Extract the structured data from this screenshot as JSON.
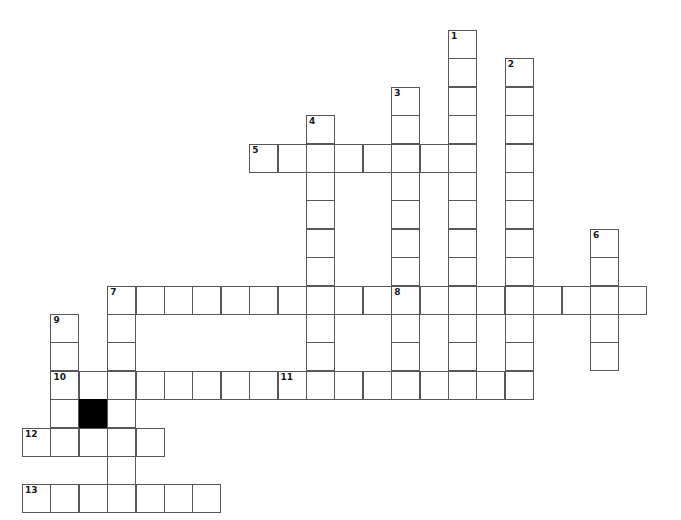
{
  "page": {
    "title_strip": "",
    "background_color": "#ffffff",
    "width": 681,
    "height": 520
  },
  "grid": {
    "cell_size": 28.4,
    "origin_x": 22,
    "origin_y": 30,
    "cell_border_color": "#58585a",
    "cell_fill_color": "#ffffff",
    "block_fill_color": "#000000",
    "number_color": "#16181b"
  },
  "clue_numbers": [
    1,
    2,
    3,
    4,
    5,
    6,
    7,
    8,
    9,
    10,
    11,
    12,
    13
  ],
  "entries": [
    {
      "number": 1,
      "direction": "down",
      "col": 15,
      "row": 0,
      "length": 11
    },
    {
      "number": 2,
      "direction": "down",
      "col": 17,
      "row": 1,
      "length": 12
    },
    {
      "number": 3,
      "direction": "down",
      "col": 13,
      "row": 2,
      "length": 8
    },
    {
      "number": 4,
      "direction": "down",
      "col": 10,
      "row": 3,
      "length": 8
    },
    {
      "number": 5,
      "direction": "across",
      "col": 8,
      "row": 4,
      "length": 8
    },
    {
      "number": 6,
      "direction": "down",
      "col": 20,
      "row": 7,
      "length": 5
    },
    {
      "number": 7,
      "direction": "across",
      "col": 3,
      "row": 9,
      "length": 10
    },
    {
      "number": 8,
      "direction": "across",
      "col": 13,
      "row": 9,
      "length": 9
    },
    {
      "number": 9,
      "direction": "down",
      "col": 1,
      "row": 10,
      "length": 5
    },
    {
      "number": 10,
      "direction": "across",
      "col": 1,
      "row": 12,
      "length": 8
    },
    {
      "number": 11,
      "direction": "across",
      "col": 9,
      "row": 12,
      "length": 9
    },
    {
      "number": 12,
      "direction": "across",
      "col": 0,
      "row": 14,
      "length": 5
    },
    {
      "number": 13,
      "direction": "across",
      "col": 0,
      "row": 16,
      "length": 7
    }
  ],
  "cells": [
    {
      "col": 15,
      "row": 0,
      "num": "1"
    },
    {
      "col": 15,
      "row": 1
    },
    {
      "col": 17,
      "row": 1,
      "num": "2"
    },
    {
      "col": 15,
      "row": 2
    },
    {
      "col": 17,
      "row": 2
    },
    {
      "col": 13,
      "row": 2,
      "num": "3"
    },
    {
      "col": 10,
      "row": 3,
      "num": "4"
    },
    {
      "col": 13,
      "row": 3
    },
    {
      "col": 15,
      "row": 3
    },
    {
      "col": 17,
      "row": 3
    },
    {
      "col": 8,
      "row": 4,
      "num": "5"
    },
    {
      "col": 9,
      "row": 4
    },
    {
      "col": 10,
      "row": 4
    },
    {
      "col": 11,
      "row": 4
    },
    {
      "col": 12,
      "row": 4
    },
    {
      "col": 13,
      "row": 4
    },
    {
      "col": 14,
      "row": 4
    },
    {
      "col": 15,
      "row": 4
    },
    {
      "col": 17,
      "row": 4
    },
    {
      "col": 10,
      "row": 5
    },
    {
      "col": 13,
      "row": 5
    },
    {
      "col": 15,
      "row": 5
    },
    {
      "col": 17,
      "row": 5
    },
    {
      "col": 10,
      "row": 6
    },
    {
      "col": 13,
      "row": 6
    },
    {
      "col": 15,
      "row": 6
    },
    {
      "col": 17,
      "row": 6
    },
    {
      "col": 10,
      "row": 7
    },
    {
      "col": 13,
      "row": 7
    },
    {
      "col": 15,
      "row": 7
    },
    {
      "col": 17,
      "row": 7
    },
    {
      "col": 20,
      "row": 7,
      "num": "6"
    },
    {
      "col": 10,
      "row": 8
    },
    {
      "col": 13,
      "row": 8
    },
    {
      "col": 15,
      "row": 8
    },
    {
      "col": 17,
      "row": 8
    },
    {
      "col": 20,
      "row": 8
    },
    {
      "col": 3,
      "row": 9,
      "num": "7"
    },
    {
      "col": 4,
      "row": 9
    },
    {
      "col": 5,
      "row": 9
    },
    {
      "col": 6,
      "row": 9
    },
    {
      "col": 7,
      "row": 9
    },
    {
      "col": 8,
      "row": 9
    },
    {
      "col": 9,
      "row": 9
    },
    {
      "col": 10,
      "row": 9
    },
    {
      "col": 11,
      "row": 9
    },
    {
      "col": 12,
      "row": 9
    },
    {
      "col": 13,
      "row": 9,
      "num": "8"
    },
    {
      "col": 14,
      "row": 9
    },
    {
      "col": 15,
      "row": 9
    },
    {
      "col": 16,
      "row": 9
    },
    {
      "col": 17,
      "row": 9
    },
    {
      "col": 18,
      "row": 9
    },
    {
      "col": 19,
      "row": 9
    },
    {
      "col": 20,
      "row": 9
    },
    {
      "col": 21,
      "row": 9
    },
    {
      "col": 1,
      "row": 10,
      "num": "9"
    },
    {
      "col": 3,
      "row": 10
    },
    {
      "col": 10,
      "row": 10
    },
    {
      "col": 13,
      "row": 10
    },
    {
      "col": 15,
      "row": 10
    },
    {
      "col": 17,
      "row": 10
    },
    {
      "col": 20,
      "row": 10
    },
    {
      "col": 1,
      "row": 11
    },
    {
      "col": 3,
      "row": 11
    },
    {
      "col": 10,
      "row": 11
    },
    {
      "col": 13,
      "row": 11
    },
    {
      "col": 15,
      "row": 11
    },
    {
      "col": 17,
      "row": 11
    },
    {
      "col": 20,
      "row": 11
    },
    {
      "col": 1,
      "row": 12,
      "num": "10"
    },
    {
      "col": 2,
      "row": 12
    },
    {
      "col": 3,
      "row": 12
    },
    {
      "col": 4,
      "row": 12
    },
    {
      "col": 5,
      "row": 12
    },
    {
      "col": 6,
      "row": 12
    },
    {
      "col": 7,
      "row": 12
    },
    {
      "col": 8,
      "row": 12
    },
    {
      "col": 9,
      "row": 12,
      "num": "11"
    },
    {
      "col": 10,
      "row": 12
    },
    {
      "col": 11,
      "row": 12
    },
    {
      "col": 12,
      "row": 12
    },
    {
      "col": 13,
      "row": 12
    },
    {
      "col": 14,
      "row": 12
    },
    {
      "col": 15,
      "row": 12
    },
    {
      "col": 16,
      "row": 12
    },
    {
      "col": 17,
      "row": 12
    },
    {
      "col": 1,
      "row": 13
    },
    {
      "col": 2,
      "row": 13,
      "block": true
    },
    {
      "col": 3,
      "row": 13
    },
    {
      "col": 0,
      "row": 14,
      "num": "12"
    },
    {
      "col": 1,
      "row": 14
    },
    {
      "col": 2,
      "row": 14
    },
    {
      "col": 3,
      "row": 14
    },
    {
      "col": 4,
      "row": 14
    },
    {
      "col": 3,
      "row": 15
    },
    {
      "col": 0,
      "row": 16,
      "num": "13"
    },
    {
      "col": 1,
      "row": 16
    },
    {
      "col": 2,
      "row": 16
    },
    {
      "col": 3,
      "row": 16
    },
    {
      "col": 4,
      "row": 16
    },
    {
      "col": 5,
      "row": 16
    },
    {
      "col": 6,
      "row": 16
    }
  ]
}
